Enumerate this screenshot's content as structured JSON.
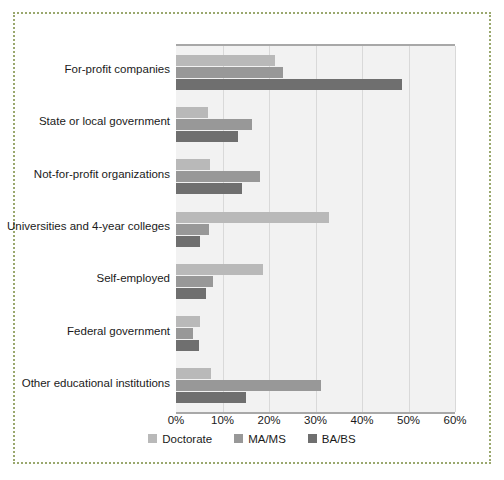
{
  "chart_data": {
    "type": "bar",
    "orientation": "horizontal",
    "title": "",
    "subtitle": "",
    "xlabel": "",
    "ylabel": "",
    "xlim": [
      0,
      60
    ],
    "xtick_labels": [
      "0%",
      "10%",
      "20%",
      "30%",
      "40%",
      "50%",
      "60%"
    ],
    "xticks": [
      0,
      10,
      20,
      30,
      40,
      50,
      60
    ],
    "grid": true,
    "legend_position": "bottom",
    "categories": [
      "For-profit companies",
      "State or local government",
      "Not-for-profit organizations",
      "Universities and 4-year colleges",
      "Self-employed",
      "Federal government",
      "Other educational institutions"
    ],
    "series": [
      {
        "name": "Doctorate",
        "color": "#b9b9b9",
        "values": [
          21.3,
          6.9,
          7.3,
          32.9,
          18.7,
          5.2,
          7.6
        ]
      },
      {
        "name": "MA/MS",
        "color": "#989898",
        "values": [
          23.0,
          16.4,
          18.1,
          7.1,
          7.9,
          3.7,
          31.2
        ]
      },
      {
        "name": "BA/BS",
        "color": "#6f6f6f",
        "values": [
          48.6,
          13.3,
          14.2,
          5.2,
          6.5,
          5.0,
          15.1
        ]
      }
    ]
  },
  "colors": {
    "plot_background": "#f2f2f2",
    "gridline": "#d9d9d9",
    "axis": "#a8a8a8",
    "frame": "#9aa86e",
    "text": "#1a1a1a"
  }
}
